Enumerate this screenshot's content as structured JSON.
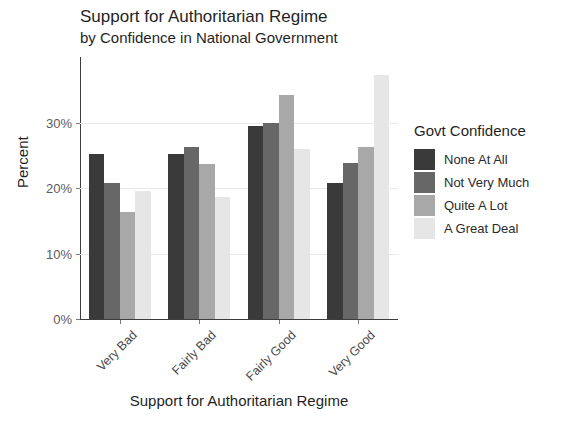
{
  "chart_data": {
    "type": "bar",
    "title": "Support for Authoritarian Regime",
    "subtitle": "by Confidence in National Government",
    "xlabel": "Support for Authoritarian Regime",
    "ylabel": "Percent",
    "categories": [
      "Very Bad",
      "Fairly Bad",
      "Fairly Good",
      "Very Good"
    ],
    "series": [
      {
        "name": "None At All",
        "color": "#3a3a3a",
        "values": [
          25.2,
          25.2,
          29.5,
          20.8
        ]
      },
      {
        "name": "Not Very Much",
        "color": "#676767",
        "values": [
          20.8,
          26.2,
          29.9,
          23.8
        ]
      },
      {
        "name": "Quite A Lot",
        "color": "#a8a8a8",
        "values": [
          16.3,
          23.7,
          34.2,
          26.2
        ]
      },
      {
        "name": "A Great Deal",
        "color": "#e6e6e6",
        "values": [
          19.5,
          18.7,
          25.9,
          37.2
        ]
      }
    ],
    "legend_title": "Govt Confidence",
    "legend_position": "right",
    "ylim": [
      0,
      40
    ],
    "yticks": [
      0,
      10,
      20,
      30
    ],
    "ytick_labels": [
      "0%",
      "10%",
      "20%",
      "30%"
    ],
    "grid": true
  }
}
